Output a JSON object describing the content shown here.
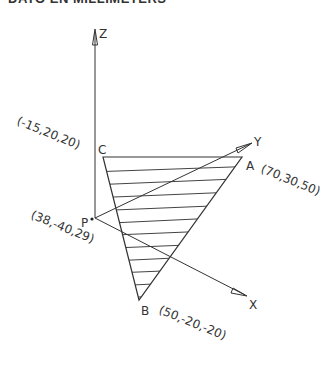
{
  "header": {
    "title": "DATO EN MILLIMETERS"
  },
  "axes": {
    "z": {
      "label": "Z"
    },
    "y": {
      "label": "Y"
    },
    "x": {
      "label": "X"
    }
  },
  "points": {
    "P": {
      "label": "P",
      "coords": "(38,-40,29)"
    },
    "A": {
      "label": "A",
      "coords": "(70,30,50)"
    },
    "B": {
      "label": "B",
      "coords": "(50,-20,-20)"
    },
    "C": {
      "label": "C",
      "coords": "(-15,20,20)"
    }
  },
  "colors": {
    "line": "#333333",
    "background": "#ffffff"
  }
}
